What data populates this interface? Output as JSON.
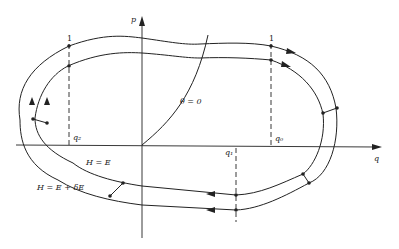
{
  "diagram": {
    "type": "phase-space orbit diagram",
    "axes": {
      "horizontal_label": "q",
      "vertical_label": "p"
    },
    "curves": {
      "inner_label": "H = E",
      "outer_label": "H = E + δE",
      "theta_line_label": "θ = 0"
    },
    "markers": {
      "left_top": "1",
      "right_top": "1",
      "q2": "q₂",
      "q0": "q₀",
      "q1": "q₁"
    }
  }
}
